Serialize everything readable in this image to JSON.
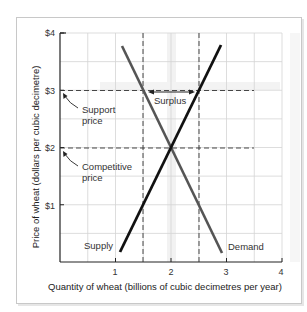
{
  "chart_data": {
    "type": "line",
    "title": "",
    "xlabel": "Quantity of wheat (billions of cubic decimetres per year)",
    "ylabel": "Price of wheat (dollars per cubic decimetre)",
    "xlim": [
      0,
      4
    ],
    "ylim": [
      0,
      4
    ],
    "x_ticks": [
      "1",
      "2",
      "3",
      "4"
    ],
    "y_ticks": [
      "$1",
      "$2",
      "$3",
      "$4"
    ],
    "grid": true,
    "grid_step": 0.5,
    "series": [
      {
        "name": "Supply",
        "color": "#111111",
        "points": [
          [
            1.08,
            0.18
          ],
          [
            2.92,
            3.75
          ]
        ]
      },
      {
        "name": "Demand",
        "color": "#555555",
        "points": [
          [
            1.12,
            3.75
          ],
          [
            2.93,
            0.16
          ]
        ]
      }
    ],
    "reference_lines": [
      {
        "type": "horizontal",
        "y": 3,
        "label": "Support price",
        "style": "dashed"
      },
      {
        "type": "horizontal",
        "y": 2,
        "label": "Competitive price",
        "style": "dashed"
      },
      {
        "type": "vertical",
        "x": 1.5,
        "style": "dashed"
      },
      {
        "type": "vertical",
        "x": 2.5,
        "style": "dashed"
      }
    ],
    "annotations": [
      {
        "text": "Surplus",
        "x_from": 1.5,
        "x_to": 2.5,
        "y": 3,
        "arrow": "double"
      },
      {
        "text": "Support price",
        "arrow_to": [
          0,
          3
        ]
      },
      {
        "text": "Competitive price",
        "arrow_to": [
          0,
          2
        ]
      },
      {
        "text": "Supply",
        "near": [
          1.08,
          0.18
        ]
      },
      {
        "text": "Demand",
        "near": [
          2.93,
          0.16
        ]
      }
    ],
    "equilibrium": {
      "quantity": 2,
      "price": 2
    },
    "support_price": {
      "price": 3,
      "quantity_demanded": 1.5,
      "quantity_supplied": 2.5,
      "surplus": 1
    }
  },
  "labels": {
    "x_title": "Quantity of wheat (billions of cubic decimetres per year)",
    "y_title": "Price of wheat (dollars per cubic decimetre)",
    "x_ticks": [
      "1",
      "2",
      "3",
      "4"
    ],
    "y_ticks": [
      "$1",
      "$2",
      "$3",
      "$4"
    ],
    "support_line1": "Support",
    "support_line2": "price",
    "competitive_line1": "Competitive",
    "competitive_line2": "price",
    "surplus": "Surplus",
    "supply": "Supply",
    "demand": "Demand"
  }
}
